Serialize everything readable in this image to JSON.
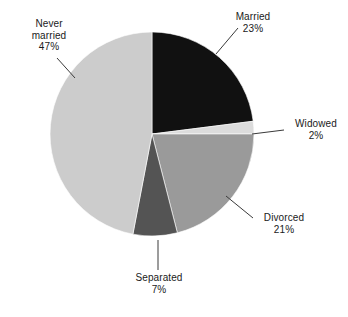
{
  "chart_data": {
    "type": "pie",
    "title": "",
    "categories": [
      "Married",
      "Widowed",
      "Divorced",
      "Separated",
      "Never married"
    ],
    "values": [
      23,
      2,
      21,
      7,
      47
    ],
    "value_unit": "%",
    "start_angle_deg": 0,
    "direction": "clockwise",
    "legend": "none",
    "labels_position": "outside-with-leader-lines",
    "slices": [
      {
        "label": "Married",
        "value": 23,
        "value_text": "23%",
        "color": "#111111"
      },
      {
        "label": "Widowed",
        "value": 2,
        "value_text": "2%",
        "color": "#dcdcdc"
      },
      {
        "label": "Divorced",
        "value": 21,
        "value_text": "21%",
        "color": "#9a9a9a"
      },
      {
        "label": "Separated",
        "value": 7,
        "value_text": "7%",
        "color": "#545454"
      },
      {
        "label": "Never married",
        "value": 47,
        "value_text": "47%",
        "color": "#cccccc"
      }
    ]
  },
  "labels": {
    "married": {
      "line1": "Married",
      "line2": "23%"
    },
    "widowed": {
      "line1": "Widowed",
      "line2": "2%"
    },
    "divorced": {
      "line1": "Divorced",
      "line2": "21%"
    },
    "separated": {
      "line1": "Separated",
      "line2": "7%"
    },
    "never_married": {
      "line1": "Never",
      "line2": "married",
      "line3": "47%"
    }
  },
  "colors": {
    "background": "#ffffff",
    "text": "#1a1a1a",
    "leader_line": "#3a3a3a",
    "married": "#111111",
    "widowed": "#dcdcdc",
    "divorced": "#9a9a9a",
    "separated": "#545454",
    "never_married": "#cccccc"
  },
  "geometry": {
    "center_x": 152,
    "center_y": 134,
    "radius": 102
  }
}
